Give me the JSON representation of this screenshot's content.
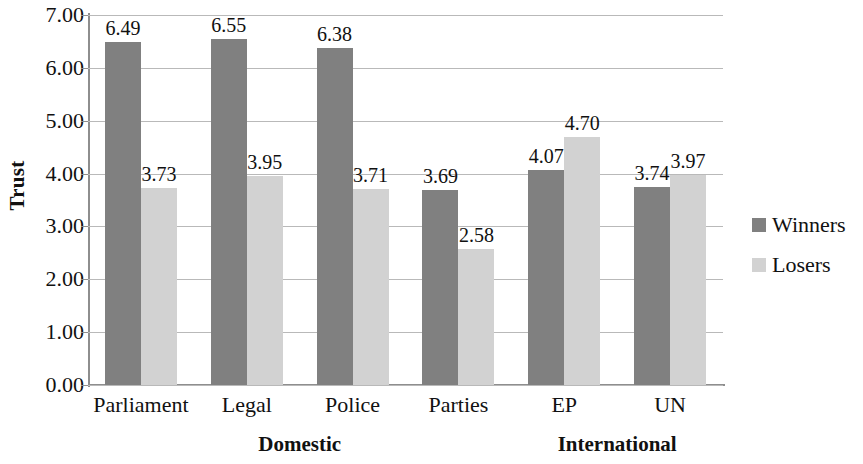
{
  "chart_data": {
    "type": "bar",
    "title": "",
    "xlabel": "",
    "ylabel": "Trust",
    "ylim": [
      0,
      7
    ],
    "ytick_step": 1,
    "grid": true,
    "legend_position": "right",
    "categories": [
      "Parliament",
      "Legal",
      "Police",
      "Parties",
      "EP",
      "UN"
    ],
    "series": [
      {
        "name": "Winners",
        "color": "#808080",
        "values": [
          6.49,
          6.55,
          6.38,
          3.69,
          4.07,
          3.74
        ]
      },
      {
        "name": "Losers",
        "color": "#d2d2d2",
        "values": [
          3.73,
          3.95,
          3.71,
          2.58,
          4.7,
          3.97
        ]
      }
    ],
    "ytick_labels": [
      "7.00",
      "6.00",
      "5.00",
      "4.00",
      "3.00",
      "2.00",
      "1.00",
      "0.00"
    ],
    "ytick_values": [
      7,
      6,
      5,
      4,
      3,
      2,
      1,
      0
    ],
    "value_labels": [
      [
        "6.49",
        "3.73"
      ],
      [
        "6.55",
        "3.95"
      ],
      [
        "6.38",
        "3.71"
      ],
      [
        "3.69",
        "2.58"
      ],
      [
        "4.07",
        "4.70"
      ],
      [
        "3.74",
        "3.97"
      ]
    ],
    "groups": [
      {
        "label": "Domestic",
        "categories": [
          "Parliament",
          "Legal",
          "Police",
          "Parties"
        ]
      },
      {
        "label": "International",
        "categories": [
          "EP",
          "UN"
        ]
      }
    ]
  },
  "legend": {
    "items": [
      {
        "label": "Winners",
        "color": "#808080"
      },
      {
        "label": "Losers",
        "color": "#d2d2d2"
      }
    ]
  }
}
